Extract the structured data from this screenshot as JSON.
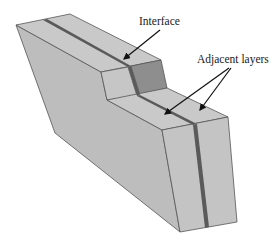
{
  "diagram": {
    "labels": {
      "interface": "Interface",
      "adjacent_layers": "Adjacent layers"
    },
    "colors": {
      "face_light": "#c4c4c4",
      "face_mid": "#b8b8b8",
      "face_dark": "#8e8e8e",
      "interface_band": "#5a5a5a",
      "edge": "#555555",
      "arrow": "#111111"
    }
  }
}
